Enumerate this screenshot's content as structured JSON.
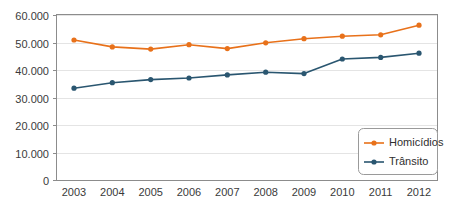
{
  "chart_data": {
    "type": "line",
    "title": "",
    "subtitle": "",
    "xlabel": "",
    "ylabel": "",
    "x": [
      "2003",
      "2004",
      "2005",
      "2006",
      "2007",
      "2008",
      "2009",
      "2010",
      "2011",
      "2012"
    ],
    "categories": [
      "2003",
      "2004",
      "2005",
      "2006",
      "2007",
      "2008",
      "2009",
      "2010",
      "2011",
      "2012"
    ],
    "series": [
      {
        "name": "Homicídios",
        "color": "#E8711A",
        "marker": "circle",
        "values": [
          50900,
          48400,
          47600,
          49200,
          47800,
          49900,
          51400,
          52300,
          52800,
          56300
        ]
      },
      {
        "name": "Trânsito",
        "color": "#2A5670",
        "marker": "circle",
        "values": [
          33400,
          35400,
          36500,
          37100,
          38200,
          39200,
          38700,
          44000,
          44600,
          46100
        ]
      }
    ],
    "ylim": [
      0,
      60000
    ],
    "xlim": [
      "2003",
      "2012"
    ],
    "y_ticks": [
      0,
      10000,
      20000,
      30000,
      40000,
      50000,
      60000
    ],
    "y_tick_labels": [
      "0",
      "10.000",
      "20.000",
      "30.000",
      "40.000",
      "50.000",
      "60.000"
    ],
    "x_tick_labels": [
      "2003",
      "2004",
      "2005",
      "2006",
      "2007",
      "2008",
      "2009",
      "2010",
      "2011",
      "2012"
    ],
    "grid": "horizontal",
    "legend_position": "lower-right",
    "legend_entries": [
      "Homicídios",
      "Trânsito"
    ]
  },
  "legend": {
    "items": [
      {
        "label": "Homicídios",
        "color": "#E8711A"
      },
      {
        "label": "Trânsito",
        "color": "#2A5670"
      }
    ]
  },
  "colors": {
    "series_homicidios": "#E8711A",
    "series_transito": "#2A5670",
    "grid": "#E4E4E4",
    "frame": "#8C8C8C",
    "text": "#3A3A3A",
    "background": "#FFFFFF"
  }
}
